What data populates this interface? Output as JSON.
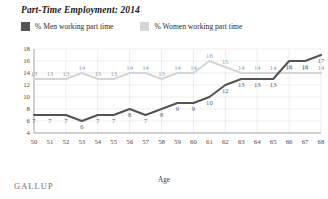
{
  "chart_data": {
    "type": "line",
    "title": "Part-Time Employment: 2014",
    "xlabel": "Age",
    "ylabel": "",
    "x": [
      50,
      51,
      52,
      53,
      54,
      55,
      56,
      57,
      58,
      59,
      60,
      61,
      62,
      63,
      64,
      65,
      66,
      67,
      68
    ],
    "categories": [
      "50",
      "51",
      "52",
      "53",
      "54",
      "55",
      "56",
      "57",
      "58",
      "59",
      "60",
      "61",
      "62",
      "63",
      "64",
      "65",
      "66",
      "67",
      "68"
    ],
    "series": [
      {
        "name": "% Men working part time",
        "color": "#545454",
        "values": [
          7,
          7,
          7,
          6,
          7,
          7,
          8,
          7,
          8,
          9,
          9,
          10,
          12,
          13,
          13,
          13,
          16,
          16,
          17
        ],
        "labels": [
          "7",
          "7",
          "7",
          "6",
          "7",
          "7",
          "8",
          "7",
          "8",
          "9",
          "9",
          "10",
          "12",
          "13",
          "13",
          "13",
          "16",
          "16",
          "17"
        ]
      },
      {
        "name": "% Women working part time",
        "color": "#d5d5d5",
        "values": [
          13,
          13,
          13,
          14,
          13,
          13,
          14,
          14,
          13,
          14,
          14,
          16,
          15,
          14,
          14,
          14,
          14,
          14,
          14
        ],
        "labels": [
          "13",
          "13",
          "13",
          "14",
          "13",
          "13",
          "14",
          "14",
          "13",
          "14",
          "14",
          "16",
          "15",
          "14",
          "14",
          "14",
          "14",
          "14",
          "14"
        ]
      }
    ],
    "ylim": [
      4,
      18
    ],
    "yticks": [
      4,
      6,
      8,
      10,
      12,
      14,
      16,
      18
    ],
    "ytick_labels": [
      "4",
      "6",
      "8",
      "10",
      "12",
      "14",
      "16",
      "18"
    ],
    "grid": true,
    "legend_position": "top-left"
  },
  "legend": {
    "men": {
      "label": "% Men working part time",
      "color": "#545454",
      "swatch": "legend-swatch-men"
    },
    "women": {
      "label": "% Women working part time",
      "color": "#d5d5d5",
      "swatch": "legend-swatch-women"
    }
  },
  "footer": {
    "brand": "GALLUP"
  },
  "axis": {
    "x_title": "Age"
  }
}
